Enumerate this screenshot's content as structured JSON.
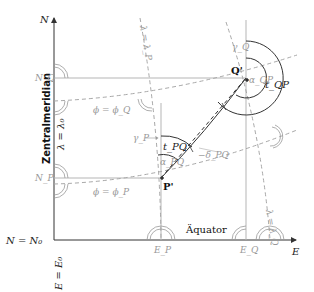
{
  "axes": {
    "north_label": "N",
    "east_label": "E",
    "origin_north": "N = N₀",
    "origin_east": "E = E₀"
  },
  "central_meridian": {
    "label": "Zentralmeridian",
    "equation": "λ = λ₀"
  },
  "equator": {
    "label": "Äquator"
  },
  "points": {
    "P": {
      "label": "P'"
    },
    "Q": {
      "label": "Q'"
    }
  },
  "grid_labels": {
    "N_Q": "N_Q",
    "N_P": "N_P",
    "E_P": "E_P",
    "E_Q": "E_Q"
  },
  "parallels": {
    "phi_Q": "ϕ = ϕ_Q",
    "phi_P": "ϕ = ϕ_P"
  },
  "meridians": {
    "lambda_P": "λ = λ_P",
    "lambda_Q": "λ = λ_Q"
  },
  "angles": {
    "gamma_P": "γ_P",
    "gamma_Q": "γ_Q",
    "t_PQ": "t_PQ",
    "t_QP": "t_QP",
    "alpha_PQ": "α_PQ",
    "alpha_QP": "α_QP",
    "delta_PQ": "−δ_PQ"
  },
  "colors": {
    "axis": "#333333",
    "grid": "#b0b0b0",
    "dashed": "#a8a8a8",
    "arc": "#333333",
    "gray_text": "#999999"
  }
}
